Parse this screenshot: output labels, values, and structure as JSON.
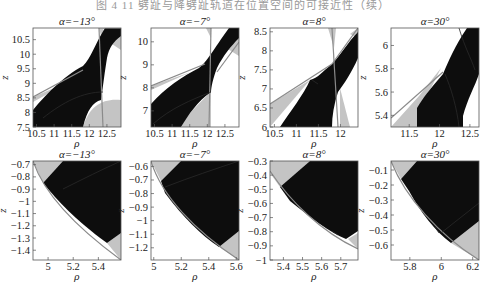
{
  "figure": {
    "caption": "图 4  11  劈趾与降劈趾轨道在位置空间的可接近性（续）"
  },
  "chart_data": [
    {
      "type": "heatmap",
      "row": 0,
      "col": 0,
      "title": "α=−13°",
      "xlabel": "ρ",
      "ylabel": "z",
      "xlim": [
        10.4,
        12.9
      ],
      "ylim": [
        7.5,
        10.9
      ],
      "xticks": [
        "10.5",
        "11",
        "11.5",
        "12",
        "12.5"
      ],
      "yticks": [
        "7.5",
        "8",
        "8.5",
        "9",
        "9.5",
        "10",
        "10.5"
      ],
      "regions": [
        "accessible (black)",
        "partially accessible (gray)",
        "forbidden (white)"
      ]
    },
    {
      "type": "heatmap",
      "row": 0,
      "col": 1,
      "title": "α=−7°",
      "xlabel": "ρ",
      "ylabel": "z",
      "xlim": [
        10.4,
        12.9
      ],
      "ylim": [
        6.3,
        10.6
      ],
      "xticks": [
        "10.5",
        "11",
        "11.5",
        "12",
        "12.5"
      ],
      "yticks": [
        "7",
        "8",
        "9",
        "10"
      ],
      "regions": [
        "accessible (black)",
        "partially accessible (gray)",
        "forbidden (white)"
      ]
    },
    {
      "type": "heatmap",
      "row": 0,
      "col": 2,
      "title": "α=8°",
      "xlabel": "ρ",
      "ylabel": "z",
      "xlim": [
        10.4,
        12.4
      ],
      "ylim": [
        6.0,
        8.6
      ],
      "xticks": [
        "10.5",
        "11",
        "11.5",
        "12"
      ],
      "yticks": [
        "6",
        "6.5",
        "7",
        "7.5",
        "8",
        "8.5"
      ],
      "regions": [
        "accessible (black)",
        "partially accessible (gray)",
        "forbidden (white)"
      ]
    },
    {
      "type": "heatmap",
      "row": 0,
      "col": 3,
      "title": "α=30°",
      "xlabel": "ρ",
      "ylabel": "z",
      "xlim": [
        11.2,
        12.65
      ],
      "ylim": [
        5.3,
        6.15
      ],
      "xticks": [
        "11.5",
        "12",
        "12.5"
      ],
      "yticks": [
        "5.4",
        "5.6",
        "5.8",
        "6"
      ],
      "regions": [
        "accessible (black)",
        "partially accessible (gray)",
        "forbidden (white)"
      ]
    },
    {
      "type": "heatmap",
      "row": 1,
      "col": 0,
      "title": "α=−13°",
      "xlabel": "ρ",
      "ylabel": "z",
      "xlim": [
        4.88,
        5.58
      ],
      "ylim": [
        -1.48,
        -0.67
      ],
      "xticks": [
        "5",
        "5.2",
        "5.4"
      ],
      "yticks": [
        "-0.7",
        "-0.8",
        "-0.9",
        "-1",
        "-1.1",
        "-1.2",
        "-1.3",
        "-1.4"
      ],
      "regions": [
        "accessible (black)",
        "partially accessible (gray)",
        "forbidden (white)"
      ]
    },
    {
      "type": "heatmap",
      "row": 1,
      "col": 1,
      "title": "α=−7°",
      "xlabel": "ρ",
      "ylabel": "z",
      "xlim": [
        4.98,
        5.62
      ],
      "ylim": [
        -1.29,
        -0.56
      ],
      "xticks": [
        "5",
        "5.2",
        "5.4",
        "5.6"
      ],
      "yticks": [
        "-0.6",
        "-0.7",
        "-0.8",
        "-0.9",
        "-1",
        "-1.1",
        "-1.2"
      ],
      "regions": [
        "accessible (black)",
        "partially accessible (gray)",
        "forbidden (white)"
      ]
    },
    {
      "type": "heatmap",
      "row": 1,
      "col": 2,
      "title": "α=8°",
      "xlabel": "ρ",
      "ylabel": "z",
      "xlim": [
        5.33,
        5.79
      ],
      "ylim": [
        -1.0,
        -0.3
      ],
      "xticks": [
        "5.4",
        "5.5",
        "5.6",
        "5.7"
      ],
      "yticks": [
        "-0.3",
        "-0.4",
        "-0.5",
        "-0.6",
        "-0.7",
        "-0.8",
        "-0.9",
        "-1"
      ],
      "regions": [
        "accessible (black)",
        "partially accessible (gray)",
        "forbidden (white)"
      ]
    },
    {
      "type": "heatmap",
      "row": 1,
      "col": 3,
      "title": "α=30°",
      "xlabel": "ρ",
      "ylabel": "z",
      "xlim": [
        5.68,
        6.24
      ],
      "ylim": [
        -0.7,
        -0.04
      ],
      "xticks": [
        "5.8",
        "6",
        "6.2"
      ],
      "yticks": [
        "-0.1",
        "-0.2",
        "-0.3",
        "-0.4",
        "-0.5",
        "-0.6"
      ],
      "regions": [
        "accessible (black)",
        "partially accessible (gray)",
        "forbidden (white)"
      ]
    }
  ],
  "colors": {
    "accessible": "#0d0d0d",
    "partial": "#c4c4c4",
    "forbidden": "#ffffff",
    "boundary": "#8a8a8a"
  },
  "layout": {
    "col_x": [
      33,
      151,
      270,
      391
    ],
    "plot_w": 88,
    "row_y": [
      28,
      161
    ],
    "plot_h": 99
  },
  "shapes": [
    {
      "gray": [
        [
          "M0,69 L40,52 L0,74 Z"
        ],
        [
          "M50,99 C56,78 70,70 88,72 L88,99 Z"
        ],
        [
          "M66,0 L70,0 L72,8 L68,8 Z"
        ],
        [
          "M76,14 L88,6 L88,22 Z"
        ]
      ],
      "dark": "M0,82 C10,70 30,48 50,38 C58,30 62,16 72,0 L88,0 L88,8 C80,14 76,20 74,30 C72,42 70,58 68,72 C60,74 54,82 50,99 L0,99 Z",
      "edges": [
        "M0,69 L50,42",
        "M66,0 L70,99",
        "M70,0 L88,0"
      ],
      "inner": [
        "M10,90 C30,74 50,64 70,64"
      ]
    },
    {
      "gray": [
        [
          "M0,58 L40,44 L0,62 Z"
        ],
        [
          "M30,99 C40,80 56,70 60,62 L60,99 Z"
        ],
        [
          "M55,0 L60,0 L60,10 Z"
        ],
        [
          "M72,18 L88,6 L88,28 Z"
        ]
      ],
      "dark": "M0,76 C14,60 32,48 48,40 C56,34 62,22 78,0 L88,0 L88,10 C80,18 72,28 66,40 C62,50 60,60 60,64 C46,74 38,86 30,99 L0,99 Z",
      "edges": [
        "M0,58 L54,36",
        "M60,0 L58,99",
        "M88,14 L66,44"
      ],
      "inner": [
        "M2,96 C20,80 40,72 60,64"
      ]
    },
    {
      "gray": [
        [
          "M0,76 L40,52 L0,99 Z"
        ],
        [
          "M58,0 L66,0 L64,20 Z"
        ],
        [
          "M70,60 L80,99 L70,99 Z"
        ],
        [
          "M80,6 L88,0 L88,10 Z"
        ]
      ],
      "dark": "M10,99 C20,84 34,66 40,52 C48,50 52,44 62,36 C70,28 78,14 88,4 L88,30 C82,44 74,56 68,64 C64,76 62,88 62,99 Z",
      "edges": [
        "M0,76 L62,36",
        "M62,0 L68,99",
        "M62,36 L88,0"
      ],
      "inner": [
        "M42,52 L48,56"
      ]
    },
    {
      "gray": [
        [
          "M0,99 L28,68 L50,40 L40,60 L26,80 L26,99 Z"
        ]
      ],
      "dark": "M26,99 L26,80 C32,70 38,62 52,46 C58,32 64,18 76,0 L88,0 L88,46 C84,58 76,72 72,88 L72,99 Z",
      "edges": [
        "M0,90 L52,44"
      ],
      "inner": [
        "M54,46 C60,60 66,80 68,99",
        "M68,0 C74,20 80,30 84,42"
      ]
    },
    {
      "gray": [
        [
          "M0,0 L30,0 L10,22 Z"
        ],
        [
          "M74,82 L88,72 L88,99 Z"
        ]
      ],
      "dark": "M10,22 L30,0 L88,0 L88,72 L74,82 C60,72 40,56 22,36 Z",
      "edges": [
        "M0,0 C10,30 40,64 88,99"
      ],
      "inner": [
        "M30,28 C50,18 70,8 88,0"
      ]
    },
    {
      "gray": [
        [
          "M0,0 L30,0 L10,20 Z"
        ],
        [
          "M68,86 L88,70 L88,99 Z"
        ]
      ],
      "dark": "M10,20 L30,0 L88,0 L88,70 L68,86 C50,74 32,56 14,32 Z",
      "edges": [
        "M0,0 C10,34 44,70 88,99"
      ],
      "inner": [
        "M14,26 C40,16 64,8 88,0"
      ]
    },
    {
      "gray": [
        [
          "M0,0 L40,0 L10,26 L0,12 Z"
        ],
        [
          "M78,78 L88,72 L88,88 Z"
        ]
      ],
      "dark": "M10,26 L40,0 L88,0 L88,70 L76,78 C60,72 40,56 20,40 Z",
      "edges": [
        "M0,10 C20,40 50,70 88,88"
      ],
      "inner": [
        "M62,70 L68,74"
      ]
    },
    {
      "gray": [
        [
          "M0,0 L26,0 L10,18 Z"
        ],
        [
          "M60,82 L88,60 L88,99 Z"
        ]
      ],
      "dark": "M10,18 L26,0 L88,0 L88,60 L60,82 C44,70 30,52 18,30 Z",
      "edges": [
        "M0,0 C14,36 48,74 88,99"
      ],
      "inner": [
        "M50,72 L88,42",
        "M44,66 L48,72"
      ]
    }
  ]
}
